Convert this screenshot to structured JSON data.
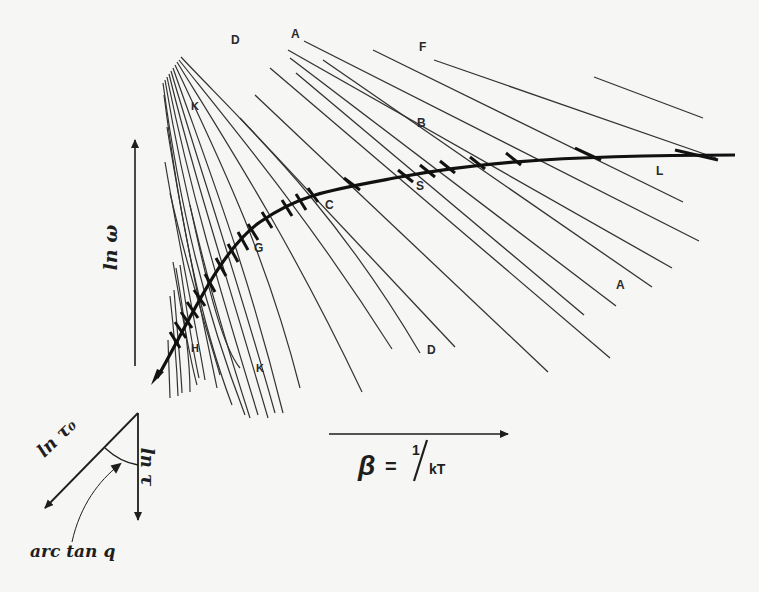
{
  "diagram": {
    "colors": {
      "background": "#f6f6f4",
      "line": "#2e2e2e",
      "curve": "#111111"
    },
    "axes": {
      "y_label": "ln ω",
      "x_label_symbol": "β",
      "x_label_eq": "=",
      "x_label_num": "1",
      "x_label_den": "kT"
    },
    "inset": {
      "ln_tau0": "ln τ₀",
      "ln_tau": "ln τ",
      "angle": "arc tan q"
    },
    "labels": {
      "A_top": "A",
      "F": "F",
      "D_top": "D",
      "K_top": "K",
      "B": "B",
      "C": "C",
      "S": "S",
      "G": "G",
      "L": "L",
      "A_right": "A",
      "D_bottom": "D",
      "H": "H",
      "K_bottom": "K"
    }
  }
}
